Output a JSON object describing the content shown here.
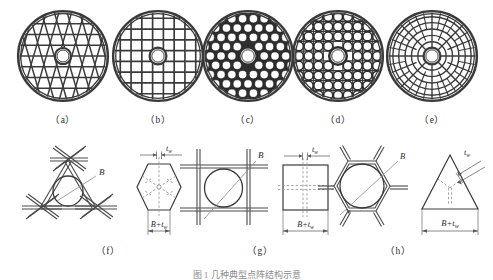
{
  "figure": {
    "caption": "图 1   几种典型点阵结构示意",
    "top_row_labels": [
      "（a）",
      "（b）",
      "（c）",
      "（d）",
      "（e）"
    ],
    "bottom_row_labels": [
      "（f）",
      "（g）",
      "（h）"
    ],
    "colors": {
      "stroke": "#333333",
      "rim": "#3a3a3a",
      "fill": "#ffffff",
      "dim_line": "#6a6a6a",
      "dashed": "#9a9a9a",
      "label_text": "#2b2b2b"
    }
  },
  "discs": [
    {
      "id": "disc-a",
      "label": "（a）",
      "lattice_type": "triangular",
      "description": "Triangular (three-direction) lattice core disc with central circular hole",
      "outer_radius_px": 48,
      "hole_radius_px": 8
    },
    {
      "id": "disc-b",
      "label": "（b）",
      "lattice_type": "square",
      "description": "Square grid lattice core disc with central circular hole",
      "outer_radius_px": 48,
      "hole_radius_px": 8
    },
    {
      "id": "disc-c",
      "label": "（c）",
      "lattice_type": "hexagonal",
      "description": "Hexagonal honeycomb lattice core disc with thick walls and central circular hole",
      "outer_radius_px": 48,
      "hole_radius_px": 8
    },
    {
      "id": "disc-d",
      "label": "（d）",
      "lattice_type": "kagome",
      "description": "Kagome / circular-cell lattice core disc with central circular hole",
      "outer_radius_px": 48,
      "hole_radius_px": 8
    },
    {
      "id": "disc-e",
      "label": "（e）",
      "lattice_type": "radial-polar",
      "description": "Radial concentric (polar) lattice core disc with central circular hole",
      "outer_radius_px": 48,
      "hole_radius_px": 8
    }
  ],
  "unit_cells": [
    {
      "id": "cell-f",
      "label": "（f）",
      "lattice_type": "triangular",
      "truss_diagram": {
        "shape": "triangle",
        "inscribed_circle_label": "B"
      },
      "envelope_diagram": {
        "shape": "hexagon",
        "wall_thickness_label": "t",
        "wall_thickness_sub": "w",
        "width_label": "B+t",
        "width_sub": "w"
      }
    },
    {
      "id": "cell-g",
      "label": "（g）",
      "lattice_type": "square",
      "truss_diagram": {
        "shape": "square-grid",
        "inscribed_circle_label": "B"
      },
      "envelope_diagram": {
        "shape": "square",
        "wall_thickness_label": "t",
        "wall_thickness_sub": "w",
        "width_label": "B+t",
        "width_sub": "w"
      }
    },
    {
      "id": "cell-h",
      "label": "（h）",
      "lattice_type": "hexagonal",
      "truss_diagram": {
        "shape": "hexagon",
        "inscribed_circle_label": "B"
      },
      "envelope_diagram": {
        "shape": "triangle",
        "wall_thickness_label": "t",
        "wall_thickness_sub": "w",
        "width_label": "B+t",
        "width_sub": "w"
      }
    }
  ]
}
